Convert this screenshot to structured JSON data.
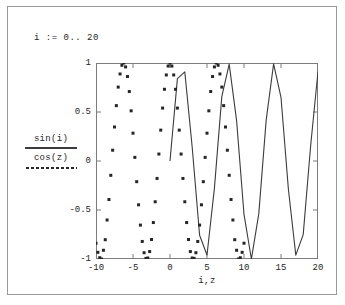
{
  "worksheet": {
    "range_definition": "i := 0.. 20"
  },
  "legend": {
    "entries": [
      {
        "label": "sin(i)",
        "style": "solid",
        "color": "#3c3c3c"
      },
      {
        "label": "cos(z)",
        "style": "dotted",
        "color": "#262626"
      }
    ]
  },
  "chart_data": {
    "type": "line",
    "title": "",
    "xlabel": "i,z",
    "ylabel": "",
    "xlim": [
      -10,
      20
    ],
    "ylim": [
      -1,
      1
    ],
    "xticks": [
      -10,
      -5,
      0,
      5,
      10,
      15,
      20
    ],
    "xtick_labels": [
      "-10",
      "-5",
      "0",
      "5",
      "10",
      "15",
      "20"
    ],
    "yticks": [
      -1,
      -0.5,
      0,
      0.5,
      1
    ],
    "ytick_labels": [
      "-1",
      "-0.5",
      "0",
      "0.5",
      "1"
    ],
    "grid": false,
    "legend_position": "left-outside",
    "series": [
      {
        "name": "sin(i)",
        "style": "solid",
        "color": "#3c3c3c",
        "x": [
          0,
          1,
          2,
          3,
          4,
          5,
          6,
          7,
          8,
          9,
          10,
          11,
          12,
          13,
          14,
          15,
          16,
          17,
          18,
          19,
          20
        ],
        "values": [
          0,
          0.841,
          0.909,
          0.141,
          -0.757,
          -0.959,
          -0.279,
          0.657,
          0.989,
          0.412,
          -0.544,
          -1,
          -0.537,
          0.42,
          0.991,
          0.65,
          -0.288,
          -0.961,
          -0.751,
          0.15,
          0.913
        ]
      },
      {
        "name": "cos(z)",
        "style": "dotted",
        "color": "#262626",
        "x": [
          -10,
          -9.75,
          -9.5,
          -9.25,
          -9,
          -8.75,
          -8.5,
          -8.25,
          -8,
          -7.75,
          -7.5,
          -7.25,
          -7,
          -6.75,
          -6.5,
          -6.25,
          -6,
          -5.75,
          -5.5,
          -5.25,
          -5,
          -4.75,
          -4.5,
          -4.25,
          -4,
          -3.75,
          -3.5,
          -3.25,
          -3,
          -2.75,
          -2.5,
          -2.25,
          -2,
          -1.75,
          -1.5,
          -1.25,
          -1,
          -0.75,
          -0.5,
          -0.25,
          0,
          0.25,
          0.5,
          0.75,
          1,
          1.25,
          1.5,
          1.75,
          2,
          2.25,
          2.5,
          2.75,
          3,
          3.25,
          3.5,
          3.75,
          4,
          4.25,
          4.5,
          4.75,
          5,
          5.25,
          5.5,
          5.75,
          6,
          6.25,
          6.5,
          6.75,
          7,
          7.25,
          7.5,
          7.75,
          8,
          8.25,
          8.5,
          8.75,
          9,
          9.25,
          9.5,
          9.75,
          10
        ],
        "values": [
          -0.839,
          -0.932,
          -0.987,
          -1.0,
          -0.911,
          -0.803,
          -0.602,
          -0.393,
          -0.146,
          0.11,
          0.347,
          0.565,
          0.754,
          0.888,
          0.977,
          1.0,
          0.96,
          0.862,
          0.709,
          0.512,
          0.284,
          0.037,
          -0.211,
          -0.447,
          -0.654,
          -0.821,
          -0.936,
          -0.994,
          -0.99,
          -0.924,
          -0.801,
          -0.628,
          -0.416,
          -0.178,
          0.071,
          0.315,
          0.54,
          0.732,
          0.878,
          0.969,
          1.0,
          0.969,
          0.878,
          0.732,
          0.54,
          0.315,
          0.071,
          -0.178,
          -0.416,
          -0.628,
          -0.801,
          -0.924,
          -0.99,
          -0.994,
          -0.936,
          -0.821,
          -0.654,
          -0.447,
          -0.211,
          0.037,
          0.284,
          0.512,
          0.709,
          0.862,
          0.96,
          1.0,
          0.977,
          0.888,
          0.754,
          0.565,
          0.347,
          0.11,
          -0.146,
          -0.393,
          -0.602,
          -0.803,
          -0.911,
          -1.0,
          -0.987,
          -0.932,
          -0.839
        ]
      }
    ]
  }
}
